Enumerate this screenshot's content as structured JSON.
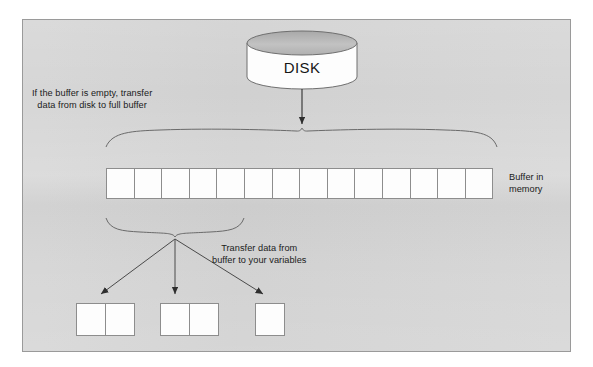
{
  "diagram": {
    "title_semantic": "disk-to-buffer-to-variables-data-flow",
    "background_color": "#d4d4d4",
    "border_color": "#9a9a9a",
    "ink_color": "#4a4a4a",
    "text_color": "#1b1b1b",
    "cell_fill": "#fdfdfd",
    "cell_stroke": "#8d8d8d",
    "disk_top_fill": "#b9b9b9",
    "disk_body_fill": "#fdfdfd"
  },
  "disk": {
    "label": "DISK"
  },
  "notes": {
    "disk_to_buffer": "If the buffer is empty, transfer\ndata from disk to full buffer",
    "buffer_to_variables": "Transfer data from\nbuffer to your variables"
  },
  "buffer": {
    "label": "Buffer in\nmemory",
    "cell_count": 14,
    "left": 106,
    "top": 168,
    "cell_width": 27.6,
    "cell_height": 31
  },
  "variables": [
    {
      "name": "variable-box-1",
      "cells": 2,
      "left": 76,
      "top": 303,
      "cell_width": 29,
      "height": 33
    },
    {
      "name": "variable-box-2",
      "cells": 2,
      "left": 160,
      "top": 303,
      "cell_width": 29,
      "height": 33
    },
    {
      "name": "variable-box-3",
      "cells": 1,
      "left": 255,
      "top": 303,
      "cell_width": 29,
      "height": 33
    }
  ],
  "arrows": [
    {
      "name": "arrow-disk-to-buffer",
      "from": [
        302,
        88
      ],
      "to": [
        302,
        127
      ]
    },
    {
      "name": "arrow-buffer-to-variable-1",
      "from": [
        175,
        238
      ],
      "to": [
        99,
        296
      ]
    },
    {
      "name": "arrow-buffer-to-variable-2",
      "from": [
        175,
        238
      ],
      "to": [
        175,
        296
      ]
    },
    {
      "name": "arrow-buffer-to-variable-3",
      "from": [
        175,
        238
      ],
      "to": [
        265,
        296
      ]
    }
  ],
  "braces": [
    {
      "name": "brace-buffer-full",
      "left": 106,
      "right": 497,
      "apex_x": 302,
      "top_y": 128,
      "bottom_y": 147
    },
    {
      "name": "brace-buffer-segment",
      "left": 106,
      "right": 244,
      "apex_x": 175,
      "top_y": 236,
      "bottom_y": 218
    }
  ]
}
